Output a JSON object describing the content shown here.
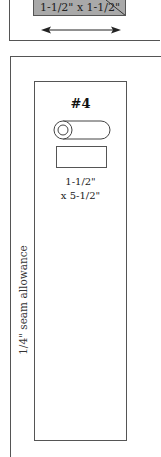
{
  "top_piece": {
    "dimension_label": "1-1/2\" x 1-1/2\"",
    "fill_color": "#a9a9a9",
    "arrow": "double-headed horizontal"
  },
  "main_piece": {
    "title": "#4",
    "dimension_line1": "1-1/2\"",
    "dimension_line2": "x 5-1/2\"",
    "seam_label": "1/4\" seam allowance"
  }
}
